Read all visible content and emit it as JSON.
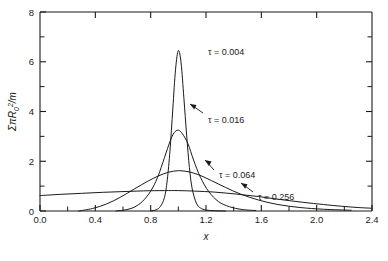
{
  "chart_data": {
    "type": "line",
    "title": "",
    "xlabel": "x",
    "ylabel": "ΣπR₀²/m",
    "xlim": [
      0.0,
      2.4
    ],
    "ylim": [
      0,
      8
    ],
    "grid": false,
    "legend_position": "inline-annotations",
    "xticks": [
      "0.0",
      "0.4",
      "0.8",
      "1.2",
      "1.6",
      "2.0",
      "2.4"
    ],
    "xtick_values": [
      0.0,
      0.4,
      0.8,
      1.2,
      1.6,
      2.0,
      2.4
    ],
    "yticks": [
      "0",
      "2",
      "4",
      "6",
      "8"
    ],
    "ytick_values": [
      0,
      2,
      4,
      6,
      8
    ],
    "yminor_values": [
      1,
      3,
      5,
      7
    ],
    "xminor_values": [
      0.2,
      0.6,
      1.0,
      1.4,
      1.8,
      2.2
    ],
    "series": [
      {
        "name": "τ = 0.004",
        "label": "τ = 0.004",
        "tau": 0.004,
        "peak_x": 1.0,
        "peak_y": 6.45,
        "x": [
          0.8,
          0.84,
          0.87,
          0.9,
          0.92,
          0.94,
          0.96,
          0.98,
          1.0,
          1.02,
          1.04,
          1.06,
          1.08,
          1.1,
          1.13,
          1.16,
          1.2,
          1.26,
          1.34
        ],
        "values": [
          0.0,
          0.05,
          0.18,
          0.55,
          1.25,
          2.45,
          4.1,
          5.7,
          6.45,
          5.95,
          4.55,
          3.05,
          1.75,
          0.9,
          0.32,
          0.12,
          0.04,
          0.01,
          0.0
        ]
      },
      {
        "name": "τ = 0.016",
        "label": "τ = 0.016",
        "tau": 0.016,
        "peak_x": 1.0,
        "peak_y": 3.25,
        "x": [
          0.55,
          0.62,
          0.68,
          0.74,
          0.8,
          0.85,
          0.9,
          0.94,
          0.97,
          1.0,
          1.03,
          1.07,
          1.11,
          1.16,
          1.22,
          1.29,
          1.37,
          1.46,
          1.56
        ],
        "values": [
          0.0,
          0.05,
          0.15,
          0.38,
          0.8,
          1.35,
          2.15,
          2.8,
          3.15,
          3.25,
          3.1,
          2.7,
          2.05,
          1.35,
          0.78,
          0.38,
          0.17,
          0.06,
          0.02
        ]
      },
      {
        "name": "τ = 0.064",
        "label": "τ = 0.064",
        "tau": 0.064,
        "peak_x": 1.0,
        "peak_y": 1.62,
        "x": [
          0.28,
          0.38,
          0.48,
          0.58,
          0.68,
          0.78,
          0.86,
          0.93,
          1.0,
          1.07,
          1.15,
          1.24,
          1.34,
          1.45,
          1.58,
          1.72,
          1.88,
          2.05,
          2.25
        ],
        "values": [
          0.0,
          0.1,
          0.28,
          0.55,
          0.88,
          1.2,
          1.42,
          1.56,
          1.62,
          1.58,
          1.45,
          1.22,
          0.95,
          0.68,
          0.44,
          0.26,
          0.14,
          0.07,
          0.03
        ]
      },
      {
        "name": "τ = 0.256",
        "label": "τ = 0.256",
        "tau": 0.256,
        "peak_x": 1.0,
        "peak_y": 0.82,
        "x": [
          0.0,
          0.15,
          0.3,
          0.45,
          0.6,
          0.75,
          0.9,
          1.0,
          1.12,
          1.26,
          1.42,
          1.58,
          1.74,
          1.9,
          2.05,
          2.18,
          2.3,
          2.4
        ],
        "values": [
          0.62,
          0.67,
          0.71,
          0.75,
          0.78,
          0.81,
          0.82,
          0.82,
          0.8,
          0.76,
          0.68,
          0.58,
          0.46,
          0.35,
          0.26,
          0.19,
          0.14,
          0.11
        ]
      }
    ],
    "annotations": [
      {
        "text": "τ = 0.004",
        "x": 1.17,
        "y": 6.0,
        "has_leader": false
      },
      {
        "text": "τ = 0.016",
        "x": 1.17,
        "y": 3.0,
        "has_leader": true
      },
      {
        "text": "τ = 0.064",
        "x": 1.3,
        "y": 1.75,
        "has_leader": true
      },
      {
        "text": "τ = 0.256",
        "x": 1.72,
        "y": 1.3,
        "has_leader": true
      }
    ]
  },
  "axis": {
    "y_label_sigma": "Σ",
    "y_label_pi": "π",
    "y_label_R": "R",
    "y_label_R_sub": "0",
    "y_label_R_sup": "2",
    "y_label_slash_m": "/m",
    "x_label": "x"
  },
  "ticks": {
    "x": [
      "0.0",
      "0.4",
      "0.8",
      "1.2",
      "1.6",
      "2.0",
      "2.4"
    ],
    "y": [
      "0",
      "2",
      "4",
      "6",
      "8"
    ]
  },
  "curves": {
    "c0": "τ = 0.004",
    "c1": "τ = 0.016",
    "c2": "τ = 0.064",
    "c3": "τ = 0.256"
  }
}
